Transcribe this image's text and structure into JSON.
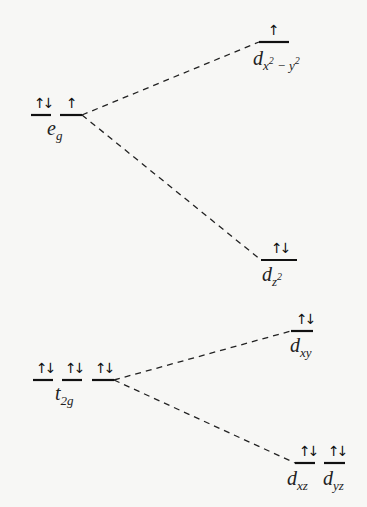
{
  "diagram": {
    "title": "",
    "type": "crystal-field-splitting",
    "colors": {
      "background": "#f7f7f5",
      "line": "#111111",
      "connector": "#222222"
    },
    "left_groups": [
      {
        "id": "eg",
        "label_main": "e",
        "label_sub": "g",
        "orbitals": [
          {
            "occupancy": "⇅",
            "spins": "↑↓"
          },
          {
            "occupancy": "↑",
            "spins": "↑"
          }
        ]
      },
      {
        "id": "t2g",
        "label_main": "t",
        "label_sub": "2g",
        "orbitals": [
          {
            "occupancy": "⇅",
            "spins": "↑↓"
          },
          {
            "occupancy": "⇅",
            "spins": "↑↓"
          },
          {
            "occupancy": "⇅",
            "spins": "↑↓"
          }
        ]
      }
    ],
    "right_levels": [
      {
        "id": "dx2-y2",
        "label_main": "d",
        "label_sub": "x",
        "label_sup1": "2",
        "label_mid": " − y",
        "label_sup2": "2",
        "spins": "↑",
        "from": "eg"
      },
      {
        "id": "dz2",
        "label_main": "d",
        "label_sub": "z",
        "label_sup1": "2",
        "spins": "↑↓",
        "from": "eg"
      },
      {
        "id": "dxy",
        "label_main": "d",
        "label_sub": "xy",
        "spins": "↑↓",
        "from": "t2g"
      },
      {
        "id": "dxz",
        "label_main": "d",
        "label_sub": "xz",
        "spins": "↑↓",
        "from": "t2g"
      },
      {
        "id": "dyz",
        "label_main": "d",
        "label_sub": "yz",
        "spins": "↑↓",
        "from": "t2g"
      }
    ]
  }
}
